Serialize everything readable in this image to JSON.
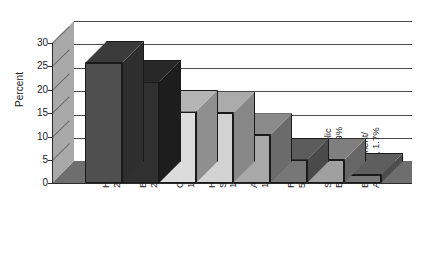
{
  "chart_data": {
    "type": "bar",
    "title": "",
    "subtitle": "",
    "xlabel": "",
    "ylabel": "Percent",
    "ylim": [
      0,
      30
    ],
    "yticks": [
      0,
      5,
      10,
      15,
      20,
      25,
      30
    ],
    "grid": true,
    "legend": false,
    "style": "3d-bar-grayscale",
    "categories": [
      "Health",
      "Education",
      "Consultant",
      "Human Services",
      "Arts",
      "Religious",
      "Society Public Benefits",
      "Environment/Animals"
    ],
    "values": [
      25.7,
      21.7,
      15.3,
      14.9,
      10.2,
      5.0,
      4.9,
      1.7
    ],
    "value_labels": [
      "25.7%",
      "21.7%",
      "15.3%",
      "14.9%",
      "10.2%",
      "5.0%",
      "4.9%",
      "1.7%"
    ],
    "tick_labels": [
      "Health\n25.7%",
      "Education\n21.7%",
      "Consultant\n15.3%",
      "Human\nServices\n14.9%",
      "Arts\n10.2%",
      "Religious\n5.0%",
      "Society Public\nBenefits, 4.9%",
      "Environment/\nAnimals, 1.7%"
    ],
    "bar_colors": [
      "#4f4f4f",
      "#303030",
      "#dcdcdc",
      "#d2d2d2",
      "#a8a8a8",
      "#777777",
      "#a0a0a0",
      "#787878"
    ],
    "bar_side_colors": [
      "#2e2e2e",
      "#1d1d1d",
      "#8f8f8f",
      "#878787",
      "#6b6b6b",
      "#4a4a4a",
      "#666666",
      "#4d4d4d"
    ],
    "bar_top_colors": [
      "#3b3b3b",
      "#272727",
      "#b4b4b4",
      "#ababab",
      "#8a8a8a",
      "#5c5c5c",
      "#7f7f7f",
      "#5e5e5e"
    ],
    "plot_colors": {
      "floor": "#6e6e6e",
      "left_wall": "#a9a9a9",
      "grid_line": "#4a4a4a",
      "axis_line": "#2b2b2b",
      "background": "#ffffff",
      "text": "#1b1b1b"
    }
  }
}
